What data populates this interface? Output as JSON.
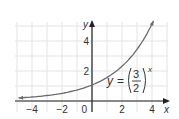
{
  "chart_data": {
    "type": "line",
    "title": "",
    "function": "y = (3/2)^x",
    "xlabel": "x",
    "ylabel": "y",
    "xlim": [
      -5,
      5
    ],
    "ylim": [
      -0.6,
      5.3
    ],
    "xticks": [
      -4,
      -2,
      0,
      2,
      4
    ],
    "yticks": [
      2,
      4
    ],
    "grid": true,
    "series": [
      {
        "name": "y = (3/2)^x",
        "x": [
          -5,
          -4,
          -3,
          -2,
          -1,
          0,
          1,
          2,
          3,
          4
        ],
        "values": [
          0.13,
          0.2,
          0.3,
          0.44,
          0.67,
          1,
          1.5,
          2.25,
          3.38,
          5.06
        ]
      }
    ],
    "annotation": {
      "lhs": "y",
      "equals": "=",
      "numerator": "3",
      "denominator": "2",
      "exponent": "x"
    },
    "tick_labels": {
      "x": [
        "-4",
        "-2",
        "0",
        "2",
        "4"
      ],
      "y": [
        "2",
        "4"
      ]
    },
    "colors": {
      "curve": "#6b6b6b",
      "axis": "#222222",
      "grid": "#e3e3e3"
    }
  }
}
